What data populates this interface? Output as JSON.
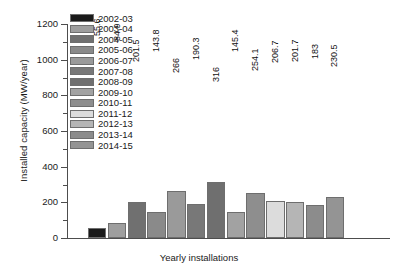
{
  "chart_data": {
    "type": "bar",
    "title": "",
    "xlabel": "Yearly installations",
    "ylabel": "Installed capacity (MW/year)",
    "ylim": [
      0,
      1200
    ],
    "ytick_labels": [
      "0",
      "200",
      "400",
      "600",
      "800",
      "1000",
      "1200"
    ],
    "ytick_values": [
      0,
      200,
      400,
      600,
      800,
      1000,
      1200
    ],
    "yminor_step": 100,
    "grid": false,
    "legend_position": "top-left-inside",
    "categories": [
      "2002-03",
      "2003-04",
      "2004-05",
      "2005-06",
      "2006-07",
      "2007-08",
      "2008-09",
      "2009-10",
      "2010-11",
      "2011-12",
      "2012-13",
      "2013-14",
      "2014-15"
    ],
    "values": [
      55.6,
      84.9,
      201.5,
      143.8,
      266,
      190.3,
      316,
      145.4,
      254.1,
      206.7,
      201.7,
      183,
      230.5
    ],
    "value_labels": [
      "55.6",
      "84.9",
      "201.5",
      "143.8",
      "266",
      "190.3",
      "316",
      "145.4",
      "254.1",
      "206.7",
      "201.7",
      "183",
      "230.5"
    ],
    "bar_colors": [
      "#1a1a1a",
      "#9e9e9e",
      "#707070",
      "#8a8a8a",
      "#9a9a9a",
      "#787878",
      "#6f6f6f",
      "#a2a2a2",
      "#8e8e8e",
      "#dcdcdc",
      "#b5b5b5",
      "#8c8c8c",
      "#949494"
    ],
    "legend_entries": [
      {
        "label": "2002-03",
        "color": "#1a1a1a"
      },
      {
        "label": "2003-04",
        "color": "#9e9e9e"
      },
      {
        "label": "2004-05",
        "color": "#707070"
      },
      {
        "label": "2005-06",
        "color": "#8a8a8a"
      },
      {
        "label": "2006-07",
        "color": "#9a9a9a"
      },
      {
        "label": "2007-08",
        "color": "#787878"
      },
      {
        "label": "2008-09",
        "color": "#6f6f6f"
      },
      {
        "label": "2009-10",
        "color": "#a2a2a2"
      },
      {
        "label": "2010-11",
        "color": "#8e8e8e"
      },
      {
        "label": "2011-12",
        "color": "#dcdcdc"
      },
      {
        "label": "2012-13",
        "color": "#b5b5b5"
      },
      {
        "label": "2013-14",
        "color": "#8c8c8c"
      },
      {
        "label": "2014-15",
        "color": "#949494"
      }
    ]
  }
}
